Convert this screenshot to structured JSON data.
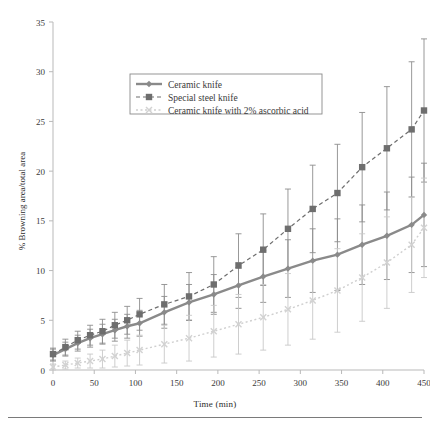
{
  "chart_data": {
    "type": "line",
    "title": "",
    "xlabel": "Time (min)",
    "ylabel": "% Browning area/total area",
    "xlim": [
      0,
      450
    ],
    "ylim": [
      0,
      35
    ],
    "xticks": [
      0,
      50,
      100,
      150,
      200,
      250,
      300,
      350,
      400,
      450
    ],
    "yticks": [
      0,
      5,
      10,
      15,
      20,
      25,
      30,
      35
    ],
    "grid": false,
    "legend_position": "upper-left-inset",
    "x": [
      0,
      15,
      30,
      45,
      60,
      75,
      90,
      105,
      135,
      165,
      195,
      225,
      255,
      285,
      315,
      345,
      375,
      405,
      435,
      450
    ],
    "series": [
      {
        "name": "Ceramic knife",
        "style": "solid",
        "marker": "diamond",
        "color": "#8a8a8a",
        "values": [
          1.5,
          2.1,
          2.7,
          3.2,
          3.6,
          4.0,
          4.4,
          4.7,
          5.8,
          6.8,
          7.6,
          8.5,
          9.4,
          10.2,
          11.0,
          11.6,
          12.6,
          13.5,
          14.6,
          15.6
        ],
        "err_up": [
          0.6,
          0.7,
          0.8,
          0.9,
          1.0,
          1.1,
          1.2,
          1.3,
          1.6,
          1.8,
          2.0,
          2.3,
          2.6,
          2.9,
          3.2,
          3.6,
          4.0,
          4.4,
          4.8,
          5.2
        ],
        "err_dn": [
          0.6,
          0.7,
          0.8,
          0.9,
          1.0,
          1.1,
          1.2,
          1.3,
          1.6,
          1.8,
          2.0,
          2.3,
          2.6,
          2.9,
          3.2,
          3.6,
          4.0,
          4.4,
          4.8,
          5.2
        ]
      },
      {
        "name": "Special steel knife",
        "style": "dashed",
        "marker": "square",
        "color": "#6e6e6e",
        "values": [
          1.6,
          2.3,
          3.0,
          3.5,
          3.9,
          4.5,
          5.0,
          5.6,
          6.6,
          7.4,
          8.6,
          10.5,
          12.1,
          14.2,
          16.2,
          17.8,
          20.4,
          22.3,
          24.2,
          26.1
        ],
        "err_up": [
          0.6,
          0.8,
          0.9,
          1.0,
          1.2,
          1.3,
          1.4,
          1.6,
          2.0,
          2.4,
          2.8,
          3.2,
          3.6,
          4.0,
          4.4,
          4.9,
          5.5,
          6.2,
          6.8,
          7.2
        ],
        "err_dn": [
          0.6,
          0.8,
          0.9,
          1.0,
          1.2,
          1.3,
          1.4,
          1.6,
          2.0,
          2.4,
          2.8,
          3.2,
          3.6,
          4.0,
          4.4,
          4.9,
          5.5,
          6.2,
          6.8,
          7.2
        ]
      },
      {
        "name": "Ceramic knife with 2% ascorbic acid",
        "style": "dotted",
        "marker": "x",
        "color": "#cfcfcf",
        "values": [
          0.3,
          0.5,
          0.7,
          0.9,
          1.1,
          1.4,
          1.7,
          2.0,
          2.6,
          3.2,
          3.9,
          4.6,
          5.3,
          6.1,
          7.0,
          8.0,
          9.3,
          10.8,
          12.6,
          14.3
        ],
        "err_up": [
          0.3,
          0.4,
          0.5,
          0.7,
          0.9,
          1.1,
          1.3,
          1.5,
          1.9,
          2.3,
          2.6,
          3.0,
          3.3,
          3.6,
          3.9,
          4.2,
          4.4,
          4.6,
          4.8,
          5.0
        ],
        "err_dn": [
          0.3,
          0.4,
          0.5,
          0.7,
          0.9,
          1.1,
          1.3,
          1.5,
          1.9,
          2.3,
          2.6,
          3.0,
          3.3,
          3.6,
          3.9,
          4.2,
          4.4,
          4.6,
          4.8,
          5.0
        ]
      }
    ]
  },
  "legend": {
    "items": [
      {
        "label": "Ceramic knife"
      },
      {
        "label": "Special steel knife"
      },
      {
        "label": "Ceramic knife with 2% ascorbic acid"
      }
    ]
  },
  "axes": {
    "x_title": "Time (min)",
    "y_title": "% Browning area/total area"
  }
}
